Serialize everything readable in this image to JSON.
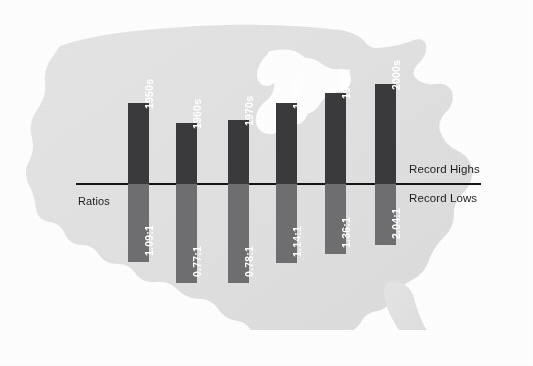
{
  "chart_data": {
    "type": "bar",
    "title": "",
    "subtitle": "",
    "xlabel": "",
    "ylabel": "Ratios",
    "categories": [
      "1950s",
      "1960s",
      "1970s",
      "1980s",
      "1990s",
      "2000s"
    ],
    "values": [
      1.09,
      0.77,
      0.78,
      1.14,
      1.36,
      2.04
    ],
    "value_labels": [
      "1.09:1",
      "0.77:1",
      "0.78:1",
      "1.14:1",
      "1.36:1",
      "2.04:1"
    ],
    "series": [
      {
        "name": "Record Highs",
        "values": [
          1.09,
          0.77,
          0.78,
          1.14,
          1.36,
          2.04
        ],
        "color": "#3a3a3c"
      },
      {
        "name": "Record Lows",
        "values": [
          1,
          1,
          1,
          1,
          1,
          1
        ],
        "color": "#6e6e70"
      }
    ],
    "annotations": [
      "Record Highs",
      "Record Lows",
      "Ratios"
    ],
    "legend_position": "right-inline",
    "grid": false,
    "background": "us-map-silhouette"
  },
  "axis": {
    "upper_label": "Record Highs",
    "lower_label": "Record Lows",
    "ratios_label": "Ratios"
  },
  "colors": {
    "bar_high": "#3a3a3c",
    "bar_low": "#6e6e70",
    "axis": "#16161a",
    "map": "#e2e2e2",
    "page": "#ffffff",
    "text": "#1d1d20",
    "bar_text": "#ffffff"
  },
  "bars": [
    {
      "decade": "1950s",
      "ratio": "1.09:1",
      "x": 128,
      "width": 21,
      "top": 103,
      "bottom": 262
    },
    {
      "decade": "1960s",
      "ratio": "0.77:1",
      "x": 176,
      "width": 21,
      "top": 123,
      "bottom": 283
    },
    {
      "decade": "1970s",
      "ratio": "0.78:1",
      "x": 228,
      "width": 21,
      "top": 120,
      "bottom": 283
    },
    {
      "decade": "1980s",
      "ratio": "1.14:1",
      "x": 276,
      "width": 21,
      "top": 103,
      "bottom": 263
    },
    {
      "decade": "1990s",
      "ratio": "1.36:1",
      "x": 325,
      "width": 21,
      "top": 93,
      "bottom": 254
    },
    {
      "decade": "2000s",
      "ratio": "2.04:1",
      "x": 375,
      "width": 21,
      "top": 84,
      "bottom": 245
    }
  ],
  "geometry": {
    "axis_y": 184,
    "axis_x_start": 76,
    "axis_x_end": 481
  }
}
